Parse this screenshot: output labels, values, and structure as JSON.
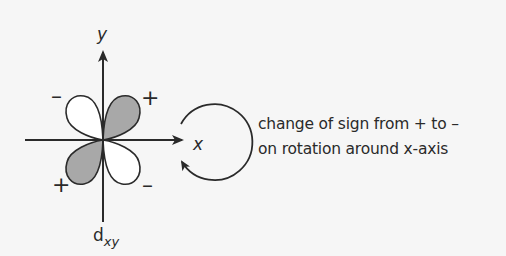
{
  "diagram": {
    "axes": {
      "x_label": "x",
      "y_label": "y"
    },
    "orbital": {
      "name": "d",
      "subscript": "xy",
      "lobes": [
        {
          "position": "top-left",
          "sign": "–",
          "fill": "#ffffff"
        },
        {
          "position": "top-right",
          "sign": "+",
          "fill": "#a8a8a8"
        },
        {
          "position": "bottom-left",
          "sign": "+",
          "fill": "#a8a8a8"
        },
        {
          "position": "bottom-right",
          "sign": "–",
          "fill": "#ffffff"
        }
      ]
    },
    "rotation_arrow": "circular-arrow around x-axis",
    "caption": {
      "line1": "change of sign from + to –",
      "line2": "on rotation around x-axis"
    },
    "colors": {
      "background": "#f6f6f6",
      "stroke": "#2a2a2a",
      "shaded_lobe": "#a8a8a8",
      "unshaded_lobe": "#ffffff"
    }
  }
}
